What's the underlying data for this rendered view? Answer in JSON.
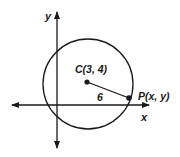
{
  "diagram": {
    "axes": {
      "x_label": "x",
      "y_label": "y"
    },
    "circle": {
      "center_label": "C(3, 4)",
      "center": [
        3,
        4
      ],
      "radius_label": "6",
      "radius": 6
    },
    "point": {
      "label": "P(x, y)"
    },
    "colors": {
      "stroke": "#1a1a1a",
      "background": "#ffffff"
    }
  }
}
